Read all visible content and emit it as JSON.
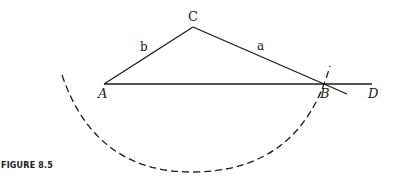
{
  "figure": {
    "caption": "FIGURE 8.5",
    "points": {
      "A": {
        "label": "A",
        "x": 104,
        "y": 84
      },
      "B": {
        "label": "B",
        "x": 322,
        "y": 84
      },
      "C": {
        "label": "C",
        "x": 193,
        "y": 27
      },
      "D": {
        "label": "D",
        "x": 372,
        "y": 84
      }
    },
    "sides": {
      "a": {
        "label": "a"
      },
      "b": {
        "label": "b"
      }
    },
    "colors": {
      "stroke": "#1a1a1a",
      "background": "#ffffff"
    }
  }
}
